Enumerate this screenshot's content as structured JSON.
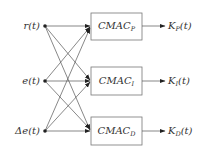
{
  "diagram": {
    "type": "block-diagram",
    "inputs": [
      {
        "id": "r",
        "label": "r(t)"
      },
      {
        "id": "e",
        "label": "e(t)"
      },
      {
        "id": "de",
        "label": "Δe(t)"
      }
    ],
    "blocks": [
      {
        "id": "P",
        "base": "CMAC",
        "sub": "P",
        "output_base": "K",
        "output_sub": "P",
        "output_arg": "(t)"
      },
      {
        "id": "I",
        "base": "CMAC",
        "sub": "I",
        "output_base": "K",
        "output_sub": "I",
        "output_arg": "(t)"
      },
      {
        "id": "D",
        "base": "CMAC",
        "sub": "D",
        "output_base": "K",
        "output_sub": "D",
        "output_arg": "(t)"
      }
    ],
    "connections": "each input connects to every CMAC block (fully connected, 9 arrows)",
    "colors": {
      "line": "#555555",
      "box_border": "#777777",
      "text": "#333333",
      "dot": "#222222"
    }
  }
}
